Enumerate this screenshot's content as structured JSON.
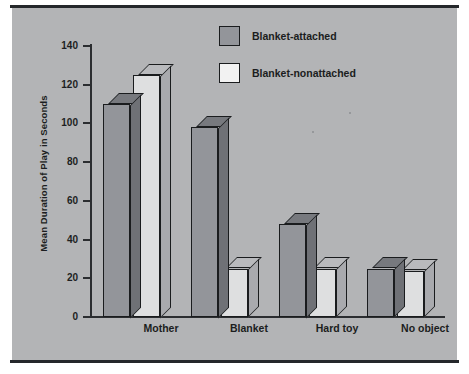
{
  "chart_data": {
    "type": "bar",
    "title": "",
    "xlabel": "",
    "ylabel": "Mean Duration of Play in Seconds",
    "ylim": [
      0,
      140
    ],
    "yticks": [
      0,
      20,
      40,
      60,
      80,
      100,
      120,
      140
    ],
    "grid": false,
    "legend_position": "top-center",
    "style": "3d-bars",
    "categories": [
      "Mother",
      "Blanket",
      "Hard toy",
      "No object"
    ],
    "series": [
      {
        "name": "Blanket-attached",
        "color": "#93959a",
        "values": [
          110,
          98,
          48,
          25
        ]
      },
      {
        "name": "Blanket-nonattached",
        "color": "#f2f2f2",
        "values": [
          125,
          25,
          25,
          24
        ]
      }
    ]
  },
  "legend": {
    "items": [
      {
        "label": "Blanket-attached",
        "swatch": "attached"
      },
      {
        "label": "Blanket-nonattached",
        "swatch": "nonattached"
      }
    ]
  },
  "axes": {
    "y_title": "Mean Duration of Play in Seconds",
    "y_ticks": [
      "140",
      "120",
      "100",
      "80",
      "60",
      "40",
      "20",
      "0"
    ],
    "x_categories": [
      "Mother",
      "Blanket",
      "Hard toy",
      "No object"
    ]
  }
}
